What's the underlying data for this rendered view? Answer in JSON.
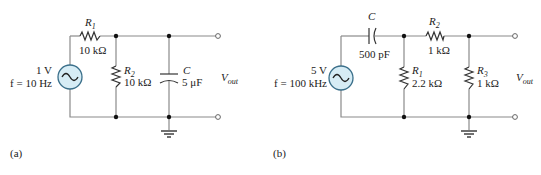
{
  "circuits": [
    {
      "id": "a",
      "caption": "(a)",
      "source": {
        "amplitude": "1 V",
        "frequency": "f = 10 Hz"
      },
      "components": [
        {
          "name": "R",
          "sub": "1",
          "value": "10 kΩ",
          "type": "resistor",
          "orientation": "series"
        },
        {
          "name": "R",
          "sub": "2",
          "value": "10 kΩ",
          "type": "resistor",
          "orientation": "shunt"
        },
        {
          "name": "C",
          "sub": "",
          "value": "5 μF",
          "type": "capacitor",
          "orientation": "shunt"
        }
      ],
      "output": {
        "name": "V",
        "sub": "out"
      }
    },
    {
      "id": "b",
      "caption": "(b)",
      "source": {
        "amplitude": "5 V",
        "frequency": "f = 100 kHz"
      },
      "components": [
        {
          "name": "C",
          "sub": "",
          "value": "500 pF",
          "type": "capacitor",
          "orientation": "series"
        },
        {
          "name": "R",
          "sub": "1",
          "value": "2.2 kΩ",
          "type": "resistor",
          "orientation": "shunt"
        },
        {
          "name": "R",
          "sub": "2",
          "value": "1 kΩ",
          "type": "resistor",
          "orientation": "series"
        },
        {
          "name": "R",
          "sub": "3",
          "value": "1 kΩ",
          "type": "resistor",
          "orientation": "shunt"
        }
      ],
      "output": {
        "name": "V",
        "sub": "out"
      }
    }
  ],
  "colors": {
    "wire": "#8a8a8a",
    "source_fill": "#d6ecf5",
    "source_stroke": "#3a6f8a",
    "node": "#111111"
  }
}
